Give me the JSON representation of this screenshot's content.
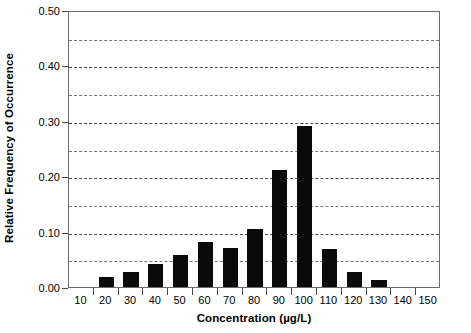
{
  "chart_data": {
    "type": "bar",
    "title": "",
    "xlabel": "Concentration (µg/L)",
    "ylabel": "Relative Frequency of Occurrence",
    "categories": [
      10,
      20,
      30,
      40,
      50,
      60,
      70,
      80,
      90,
      100,
      110,
      120,
      130,
      140,
      150
    ],
    "category_labels": [
      "10",
      "20",
      "30",
      "40",
      "50",
      "60",
      "70",
      "80",
      "90",
      "100",
      "110",
      "120",
      "130",
      "140",
      "150"
    ],
    "values": [
      0.0,
      0.018,
      0.027,
      0.041,
      0.058,
      0.082,
      0.071,
      0.105,
      0.212,
      0.29,
      0.069,
      0.028,
      0.012,
      0.0,
      0.0
    ],
    "series": [
      {
        "name": "Relative Frequency of Occurrence",
        "values": [
          0.0,
          0.018,
          0.027,
          0.041,
          0.058,
          0.082,
          0.071,
          0.105,
          0.212,
          0.29,
          0.069,
          0.028,
          0.012,
          0.0,
          0.0
        ]
      }
    ],
    "ylim": [
      0.0,
      0.5
    ],
    "xlim": [
      5,
      155
    ],
    "y_major_ticks": [
      0.0,
      0.1,
      0.2,
      0.3,
      0.4,
      0.5
    ],
    "y_major_tick_labels": [
      "0.00",
      "0.10",
      "0.20",
      "0.30",
      "0.40",
      "0.50"
    ],
    "y_gridlines": [
      0.05,
      0.1,
      0.15,
      0.2,
      0.25,
      0.3,
      0.35,
      0.4,
      0.45
    ],
    "grid": true,
    "grid_style": "dashed",
    "grid_axis": "y",
    "legend": false,
    "legend_position": "none",
    "bar_color": "#0a0a0a",
    "axis_color": "#4a4a4a",
    "background_color": "#ffffff",
    "bar_width_fraction": 0.62,
    "annotations": []
  }
}
